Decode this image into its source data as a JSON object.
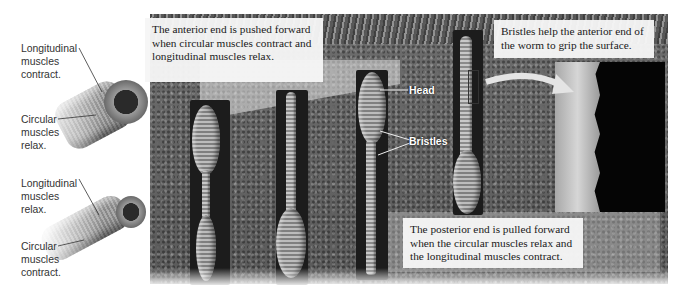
{
  "figure": {
    "callouts": {
      "anterior": "The anterior end is pushed forward when circular muscles contract and longitudinal muscles relax.",
      "bristles": "Bristles help the anterior end of the worm to grip the surface.",
      "posterior": "The posterior end is pulled forward when the circular muscles relax and the longitudinal muscles contract."
    },
    "muscle_diagram_top": {
      "label_longitudinal": [
        "Longitudinal",
        "muscles",
        "contract."
      ],
      "label_circular": [
        "Circular",
        "muscles",
        "relax."
      ]
    },
    "muscle_diagram_bottom": {
      "label_longitudinal": [
        "Longitudinal",
        "muscles",
        "relax."
      ],
      "label_circular": [
        "Circular",
        "muscles",
        "contract."
      ]
    },
    "worm_labels": {
      "head": "Head",
      "bristles": "Bristles"
    },
    "colors": {
      "callout_bg": "#f6f6f6",
      "soil": "#666666",
      "burrow": "#1c1c1c",
      "inset_bg": "#050505"
    }
  }
}
